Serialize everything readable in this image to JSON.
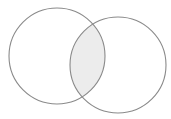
{
  "diagram": {
    "type": "venn",
    "sets": [
      {
        "id": "A",
        "cx": 57,
        "cy": 56,
        "r": 48
      },
      {
        "id": "B",
        "cx": 118,
        "cy": 65,
        "r": 48
      }
    ],
    "intersection": {
      "sets": [
        "A",
        "B"
      ],
      "shaded": true
    },
    "colors": {
      "background": "#ffffff",
      "stroke": "#8a8a8a",
      "intersection_fill": "#ececec"
    }
  }
}
